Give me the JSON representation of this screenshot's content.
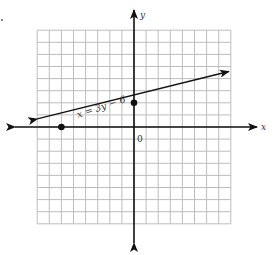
{
  "chart_data": {
    "type": "line",
    "title": "",
    "xlabel": "x",
    "ylabel": "y",
    "origin_label": "0",
    "xlim": [
      -8,
      8
    ],
    "ylim": [
      -8,
      8
    ],
    "grid": true,
    "grid_step": 1,
    "series": [
      {
        "name": "x = 3y − 6",
        "equation": "x = 3y - 6",
        "slope": 0.3333,
        "y_intercept": 2,
        "x_intercept": -6,
        "x": [
          -8,
          8
        ],
        "y": [
          0.667,
          4.667
        ],
        "marked_points": [
          {
            "x": -6,
            "y": 0
          },
          {
            "x": 0,
            "y": 2
          }
        ]
      }
    ],
    "legend": "none",
    "annotations": [
      {
        "text": "x = 3y − 6",
        "position": "along line, left of y-axis"
      }
    ]
  },
  "labels": {
    "x_axis": "x",
    "y_axis": "y",
    "origin": "0",
    "equation": "x = 3y − 6"
  }
}
